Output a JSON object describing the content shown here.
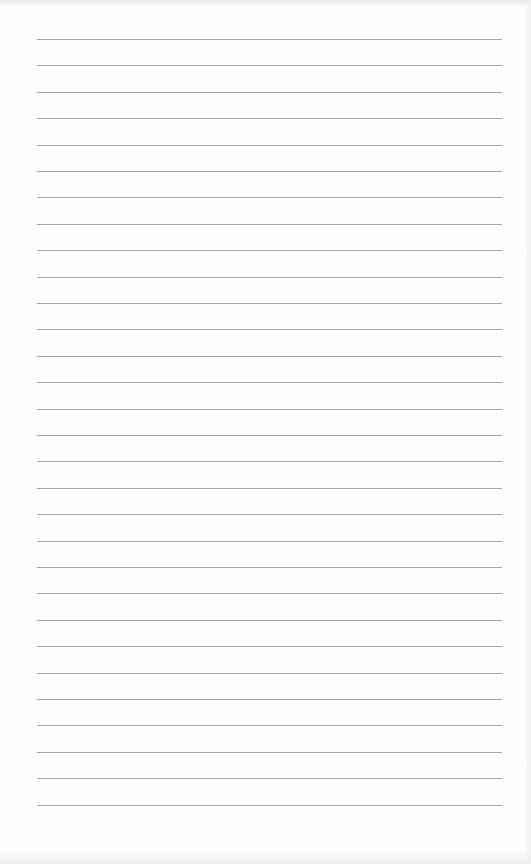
{
  "document": {
    "type": "blank ruled notebook page",
    "ruled_line_count": 30,
    "first_line_y": 39,
    "line_spacing_px": 26.4,
    "line_left_x": 37,
    "line_width_px": 465,
    "colors": {
      "paper": "#fefefe",
      "rule": "#9a9a9a"
    }
  }
}
